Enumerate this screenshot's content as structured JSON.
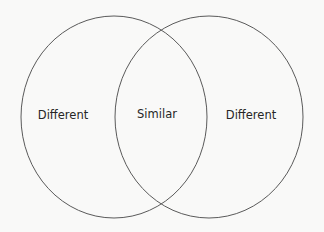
{
  "diagram": {
    "type": "venn",
    "background_color": "#f9f9f8",
    "stroke_color": "#5a5a5a",
    "text_color": "#262626",
    "sets": [
      {
        "id": "left",
        "label": "Different",
        "cx": 114,
        "cy": 117,
        "rx": 93,
        "ry": 101
      },
      {
        "id": "right",
        "label": "Different",
        "cx": 209,
        "cy": 117,
        "rx": 94,
        "ry": 101
      }
    ],
    "intersection": {
      "label": "Similar"
    }
  }
}
